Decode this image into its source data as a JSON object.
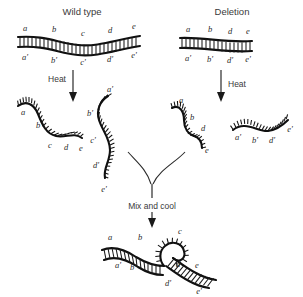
{
  "figure": {
    "background_color": "#ffffff",
    "ink_color": "#101010",
    "text_color": "#3a3a3a"
  },
  "columns": {
    "left": {
      "header": "Wild type"
    },
    "right": {
      "header": "Deletion"
    }
  },
  "steps": {
    "heat_left": "Heat",
    "heat_right": "Heat",
    "mix_and_cool": "Mix and cool"
  },
  "duplex_wild_type": {
    "top_strand": [
      "a",
      "b",
      "c",
      "d",
      "e"
    ],
    "bottom_strand": [
      "a'",
      "b'",
      "c'",
      "d'",
      "e'"
    ]
  },
  "duplex_deletion": {
    "top_strand": [
      "a",
      "b",
      "d",
      "e"
    ],
    "bottom_strand": [
      "a'",
      "b'",
      "d'",
      "e'"
    ],
    "deleted_segment": "c"
  },
  "single_strands": {
    "wild_type_sense": [
      "a",
      "b",
      "c",
      "d",
      "e"
    ],
    "wild_type_antisense": [
      "a'",
      "b'",
      "c'",
      "d'",
      "e'"
    ],
    "deletion_sense": [
      "a",
      "b",
      "d",
      "e"
    ],
    "deletion_antisense": [
      "a'",
      "b'",
      "d'",
      "e'"
    ]
  },
  "heteroduplex": {
    "top_strand": [
      "a",
      "b",
      "c",
      "d",
      "e"
    ],
    "bottom_strand": [
      "a'",
      "b'",
      "d'",
      "e'"
    ],
    "loop_label": "c"
  }
}
